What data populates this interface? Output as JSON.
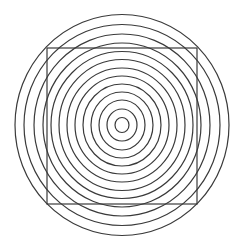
{
  "figure": {
    "type": "optical-illusion",
    "background": "#ffffff",
    "stroke_color": "#3a3a3a",
    "center": {
      "x": 122,
      "y": 125
    },
    "rings": [
      {
        "rx": 7,
        "ry": 7.5
      },
      {
        "rx": 15,
        "ry": 16
      },
      {
        "rx": 23,
        "ry": 25
      },
      {
        "rx": 31,
        "ry": 33
      },
      {
        "rx": 39,
        "ry": 41
      },
      {
        "rx": 47,
        "ry": 49
      },
      {
        "rx": 55,
        "ry": 57
      },
      {
        "rx": 63,
        "ry": 65.5
      },
      {
        "rx": 71,
        "ry": 73.5
      },
      {
        "rx": 79,
        "ry": 82
      },
      {
        "rx": 88,
        "ry": 91
      },
      {
        "rx": 98,
        "ry": 100.5
      },
      {
        "rx": 107,
        "ry": 110.5
      }
    ],
    "square": {
      "x": 47,
      "y": 48,
      "width": 150,
      "height": 156
    }
  }
}
